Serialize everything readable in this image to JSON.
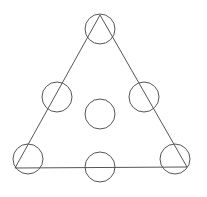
{
  "diagram": {
    "type": "triangle-with-circles",
    "stroke_color": "#555555",
    "background": "#ffffff",
    "triangle": {
      "apex": [
        100,
        15
      ],
      "bottom_left": [
        15,
        168
      ],
      "bottom_right": [
        187,
        167
      ]
    },
    "circles": [
      {
        "id": "top",
        "cx": 100,
        "cy": 29,
        "r": 15
      },
      {
        "id": "left-middle",
        "cx": 57,
        "cy": 97,
        "r": 15
      },
      {
        "id": "right-middle",
        "cx": 144,
        "cy": 97,
        "r": 15
      },
      {
        "id": "center",
        "cx": 100,
        "cy": 114,
        "r": 15
      },
      {
        "id": "bottom-left",
        "cx": 28,
        "cy": 159,
        "r": 15
      },
      {
        "id": "bottom-middle",
        "cx": 100,
        "cy": 167,
        "r": 15
      },
      {
        "id": "bottom-right",
        "cx": 175,
        "cy": 159,
        "r": 15
      }
    ]
  }
}
